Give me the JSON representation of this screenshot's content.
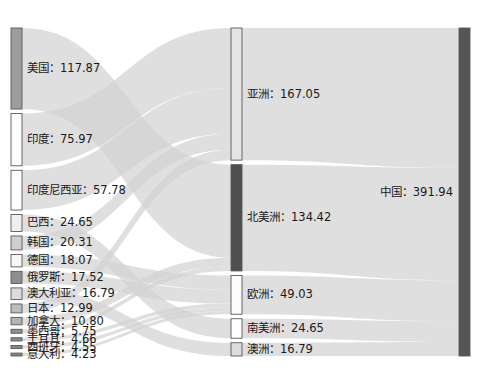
{
  "chart_data": {
    "type": "sankey",
    "title": "",
    "subtitle": "",
    "xlabel": "",
    "ylabel": "",
    "grid": false,
    "legend": "none",
    "label_separator": "：",
    "total": 391.94,
    "stages": [
      "country",
      "continent",
      "destination"
    ],
    "nodes": [
      {
        "id": "us",
        "label": "美国",
        "value": 117.87,
        "stage": 0,
        "color": "#9d9d9d"
      },
      {
        "id": "india",
        "label": "印度",
        "value": 75.97,
        "stage": 0,
        "color": "#fdfdfd"
      },
      {
        "id": "indonesia",
        "label": "印度尼西亚",
        "value": 57.78,
        "stage": 0,
        "color": "#ffffff"
      },
      {
        "id": "brazil",
        "label": "巴西",
        "value": 24.65,
        "stage": 0,
        "color": "#efefef"
      },
      {
        "id": "korea",
        "label": "韩国",
        "value": 20.31,
        "stage": 0,
        "color": "#cfcfcf"
      },
      {
        "id": "germany",
        "label": "德国",
        "value": 18.07,
        "stage": 0,
        "color": "#f7f7f7"
      },
      {
        "id": "russia",
        "label": "俄罗斯",
        "value": 17.52,
        "stage": 0,
        "color": "#8e8e8e"
      },
      {
        "id": "australia",
        "label": "澳大利亚",
        "value": 16.79,
        "stage": 0,
        "color": "#dcdcdc"
      },
      {
        "id": "japan",
        "label": "日本",
        "value": 12.99,
        "stage": 0,
        "color": "#bdbdbd"
      },
      {
        "id": "canada",
        "label": "加拿大",
        "value": 10.8,
        "stage": 0,
        "color": "#b4b4b4"
      },
      {
        "id": "mexico",
        "label": "墨西哥",
        "value": 5.75,
        "stage": 0,
        "color": "#8f8f8f"
      },
      {
        "id": "turkey",
        "label": "土耳其",
        "value": 4.66,
        "stage": 0,
        "color": "#8a8a8a"
      },
      {
        "id": "spain",
        "label": "西班牙",
        "value": 4.55,
        "stage": 0,
        "color": "#878787"
      },
      {
        "id": "italy",
        "label": "意大利",
        "value": 4.23,
        "stage": 0,
        "color": "#848484"
      },
      {
        "id": "asia",
        "label": "亚洲",
        "value": 167.05,
        "stage": 1,
        "color": "#e4e4e4"
      },
      {
        "id": "namerica",
        "label": "北美洲",
        "value": 134.42,
        "stage": 1,
        "color": "#4f4f4f"
      },
      {
        "id": "europe",
        "label": "欧洲",
        "value": 49.03,
        "stage": 1,
        "color": "#fbfbfb"
      },
      {
        "id": "samerica",
        "label": "南美洲",
        "value": 24.65,
        "stage": 1,
        "color": "#ffffff"
      },
      {
        "id": "oceania",
        "label": "澳洲",
        "value": 16.79,
        "stage": 1,
        "color": "#dcdcdc"
      },
      {
        "id": "china",
        "label": "中国",
        "value": 391.94,
        "stage": 2,
        "color": "#555555"
      }
    ],
    "links": [
      {
        "source": "us",
        "target": "namerica",
        "value": 117.87
      },
      {
        "source": "india",
        "target": "asia",
        "value": 75.97
      },
      {
        "source": "indonesia",
        "target": "asia",
        "value": 57.78
      },
      {
        "source": "brazil",
        "target": "samerica",
        "value": 24.65
      },
      {
        "source": "korea",
        "target": "asia",
        "value": 20.31
      },
      {
        "source": "germany",
        "target": "europe",
        "value": 18.07
      },
      {
        "source": "russia",
        "target": "europe",
        "value": 17.52
      },
      {
        "source": "australia",
        "target": "oceania",
        "value": 16.79
      },
      {
        "source": "japan",
        "target": "asia",
        "value": 12.99
      },
      {
        "source": "canada",
        "target": "namerica",
        "value": 10.8
      },
      {
        "source": "mexico",
        "target": "namerica",
        "value": 5.75
      },
      {
        "source": "turkey",
        "target": "europe",
        "value": 4.66
      },
      {
        "source": "spain",
        "target": "europe",
        "value": 4.55
      },
      {
        "source": "italy",
        "target": "europe",
        "value": 4.23
      },
      {
        "source": "asia",
        "target": "china",
        "value": 167.05
      },
      {
        "source": "namerica",
        "target": "china",
        "value": 134.42
      },
      {
        "source": "europe",
        "target": "china",
        "value": 49.03
      },
      {
        "source": "samerica",
        "target": "china",
        "value": 24.65
      },
      {
        "source": "oceania",
        "target": "china",
        "value": 16.79
      }
    ],
    "colors": {
      "link_default": "#d2d2d2",
      "node_stroke": "#5a5a5a",
      "label_text": "#1a1a1a",
      "background": "#ffffff"
    }
  },
  "layout": {
    "width": 483,
    "height": 369,
    "top": 28,
    "bottom": 356,
    "node_width": 11,
    "node_pad": 4.5,
    "columns_x": [
      11,
      231,
      459
    ],
    "label_font_size": 11.5
  }
}
